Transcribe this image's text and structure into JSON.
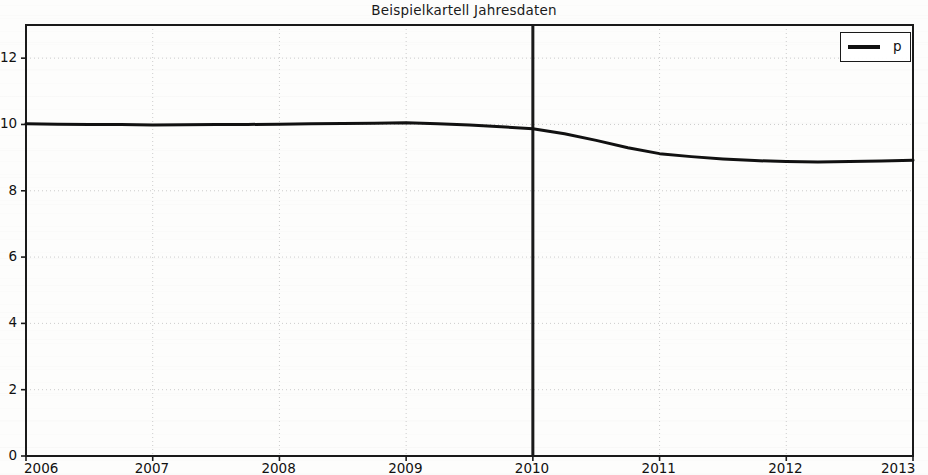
{
  "chart_data": {
    "type": "line",
    "title": "Beispielkartell Jahresdaten",
    "xlabel": "",
    "ylabel": "",
    "xlim": [
      2006,
      2013
    ],
    "ylim": [
      0,
      13
    ],
    "xticks": [
      "2006",
      "2007",
      "2008",
      "2009",
      "2010",
      "2011",
      "2012",
      "2013"
    ],
    "xtick_values": [
      2006,
      2007,
      2008,
      2009,
      2010,
      2011,
      2012,
      2013
    ],
    "yticks": [
      "0",
      "2",
      "4",
      "6",
      "8",
      "10",
      "12"
    ],
    "ytick_values": [
      0,
      2,
      4,
      6,
      8,
      10,
      12
    ],
    "grid": true,
    "grid_style": "dotted",
    "grid_color": "#cccccc",
    "legend_position": "upper right",
    "series": [
      {
        "name": "p",
        "color": "#111111",
        "linewidth": 3,
        "x": [
          2006.0,
          2006.25,
          2006.5,
          2006.75,
          2007.0,
          2007.25,
          2007.5,
          2007.75,
          2008.0,
          2008.25,
          2008.5,
          2008.75,
          2009.0,
          2009.25,
          2009.5,
          2009.75,
          2010.0,
          2010.25,
          2010.5,
          2010.75,
          2011.0,
          2011.25,
          2011.5,
          2011.75,
          2012.0,
          2012.25,
          2012.5,
          2012.75,
          2013.0
        ],
        "values": [
          10.02,
          10.01,
          10.0,
          10.0,
          9.98,
          9.99,
          10.0,
          10.0,
          10.01,
          10.02,
          10.03,
          10.04,
          10.05,
          10.02,
          9.98,
          9.93,
          9.87,
          9.72,
          9.52,
          9.3,
          9.12,
          9.03,
          8.96,
          8.91,
          8.88,
          8.87,
          8.88,
          8.9,
          8.92
        ]
      }
    ],
    "annotations": [
      {
        "name": "cartel-break-line",
        "type": "vline",
        "x": 2010,
        "color": "#1a1a1a",
        "linewidth": 3
      }
    ]
  },
  "legend": {
    "entries": [
      {
        "label": "p",
        "color": "#111111"
      }
    ]
  }
}
